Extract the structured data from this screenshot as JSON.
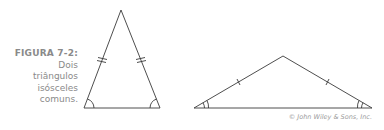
{
  "caption": {
    "label": "FIGURA 7-2:",
    "lines": [
      "Dois",
      "triângulos",
      "isósceles",
      "comuns."
    ]
  },
  "copyright": "© John Wiley & Sons, Inc.",
  "colors": {
    "stroke": "#3a3a3a",
    "caption_label": "#7a7a7a",
    "caption_text": "#8a8a8a",
    "copyright": "#9a9a9a"
  },
  "figures": [
    {
      "name": "acute-isosceles-triangle",
      "congruent_side_marks": "double-tick",
      "angle_marks": "single-arc"
    },
    {
      "name": "obtuse-isosceles-triangle",
      "congruent_side_marks": "single-tick",
      "angle_marks": "double-arc"
    }
  ]
}
